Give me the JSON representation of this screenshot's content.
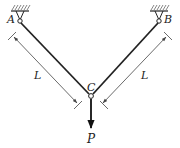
{
  "diagram": {
    "type": "two-bar truss with load",
    "points": {
      "A": {
        "label": "A"
      },
      "B": {
        "label": "B"
      },
      "C": {
        "label": "C"
      }
    },
    "members": [
      {
        "from": "A",
        "to": "C",
        "length_label": "L"
      },
      {
        "from": "B",
        "to": "C",
        "length_label": "L"
      }
    ],
    "load": {
      "at": "C",
      "label": "P",
      "direction": "down"
    },
    "supports": [
      {
        "at": "A",
        "type": "pin, fixed ceiling"
      },
      {
        "at": "B",
        "type": "pin, fixed ceiling"
      }
    ]
  },
  "labels": {
    "A": "A",
    "B": "B",
    "C": "C",
    "L_left": "L",
    "L_right": "L",
    "P": "P"
  },
  "colors": {
    "line": "#222222",
    "hatch": "#555555",
    "dim": "#444444"
  }
}
